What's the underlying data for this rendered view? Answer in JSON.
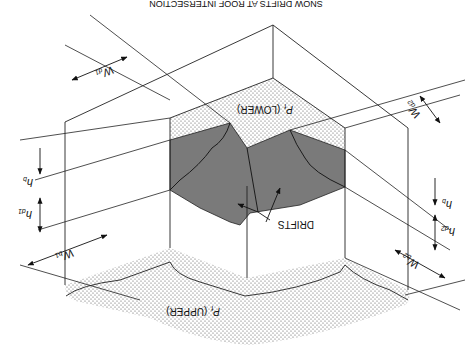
{
  "figure": {
    "title_cut": "SNOW DRIFTS AT ROOF INTERSECTION",
    "orientation": "rotated 180 degrees",
    "labels": {
      "lower_surface": "P",
      "lower_surface_sub": "f",
      "lower_surface_text": "(LOWER)",
      "upper_surface": "P",
      "upper_surface_sub": "f",
      "upper_surface_text": "(UPPER)",
      "drifts": "DRIFTS",
      "wd1": "W",
      "wd1_sub": "d1",
      "wd2": "W",
      "wd2_sub": "d2",
      "wb1": "W",
      "wb1_sub": "b1",
      "wb2": "W",
      "wb2_sub": "b2",
      "hb_left": "h",
      "hb_left_sub": "b",
      "hd1": "h",
      "hd1_sub": "d1",
      "hb_right": "h",
      "hb_right_sub": "b",
      "hd2": "h",
      "hd2_sub": "d2"
    },
    "colors": {
      "line": "#222222",
      "drift_fill": "#7a7a7a",
      "snow_dots": "#555555",
      "background": "#ffffff"
    }
  }
}
